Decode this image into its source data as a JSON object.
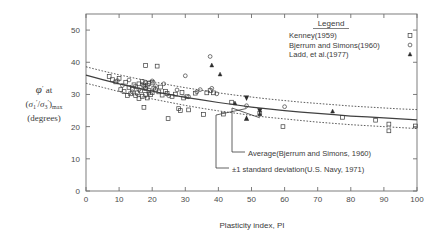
{
  "chart_data": {
    "type": "scatter",
    "title": "",
    "xlabel": "Plasticity index, PI",
    "ylabel_lines": [
      "ϕ' at",
      "(σ1'/σ3')max",
      "(degrees)"
    ],
    "xlim": [
      0,
      100
    ],
    "ylim": [
      0,
      55
    ],
    "xticks": [
      0,
      10,
      20,
      30,
      40,
      50,
      60,
      70,
      80,
      90,
      100
    ],
    "yticks": [
      0,
      10,
      20,
      30,
      40,
      50
    ],
    "xtick_labels": [
      "0",
      "10",
      "20",
      "30",
      "40",
      "50",
      "60",
      "70",
      "80",
      "90",
      "100"
    ],
    "ytick_labels": [
      "0",
      "10",
      "20",
      "30",
      "40",
      "50"
    ],
    "grid": false,
    "legend": {
      "title": "Legend",
      "position": "top-right",
      "entries": [
        {
          "name": "Kenney(1959)",
          "marker": "square",
          "marker_fill": "none"
        },
        {
          "name": "Bjerrum and Simons(1960)",
          "marker": "circle",
          "marker_fill": "none"
        },
        {
          "name": "Ladd, et al.(1977)",
          "marker": "triangle",
          "marker_fill": "solid"
        }
      ]
    },
    "annotations": [
      {
        "text": "Average(Bjerrum and Simons, 1960)",
        "points_to": [
          52.5,
          24.0
        ]
      },
      {
        "text": "±1 standard deviation(U.S. Navy, 1971)",
        "points_to": [
          48.5,
          27.0
        ]
      }
    ],
    "curves": [
      {
        "name": "Average(Bjerrum and Simons, 1960)",
        "style": "solid",
        "x": [
          0,
          5,
          10,
          15,
          20,
          25,
          30,
          35,
          40,
          45,
          50,
          55,
          60,
          65,
          70,
          75,
          80,
          85,
          90,
          95,
          100
        ],
        "y": [
          36.0,
          34.6,
          33.3,
          32.1,
          31.0,
          30.0,
          29.1,
          28.3,
          27.5,
          26.8,
          26.1,
          25.5,
          25.0,
          24.5,
          24.1,
          23.7,
          23.3,
          23.0,
          22.7,
          22.4,
          22.1
        ]
      },
      {
        "name": "+1 standard deviation",
        "style": "dotted",
        "x": [
          0,
          5,
          10,
          15,
          20,
          25,
          30,
          35,
          40,
          45,
          50,
          55,
          60,
          65,
          70,
          75,
          80,
          85,
          90,
          95,
          100
        ],
        "y": [
          38.6,
          37.3,
          36.1,
          35.0,
          34.0,
          33.0,
          32.1,
          31.3,
          30.5,
          29.8,
          29.2,
          28.6,
          28.1,
          27.6,
          27.2,
          26.8,
          26.4,
          26.1,
          25.8,
          25.5,
          25.3
        ]
      },
      {
        "name": "-1 standard deviation",
        "style": "dotted",
        "x": [
          0,
          5,
          10,
          15,
          20,
          25,
          30,
          35,
          40,
          45,
          50,
          55,
          60,
          65,
          70,
          75,
          80,
          85,
          90,
          95,
          100
        ],
        "y": [
          33.5,
          32.2,
          30.9,
          29.7,
          28.6,
          27.6,
          26.6,
          25.7,
          24.9,
          24.2,
          23.5,
          22.9,
          22.4,
          21.9,
          21.4,
          21.0,
          20.6,
          20.3,
          20.0,
          19.7,
          19.4
        ]
      }
    ],
    "series": [
      {
        "name": "Kenney(1959)",
        "marker": "square",
        "points": [
          [
            7.0,
            35.6
          ],
          [
            8.0,
            34.6
          ],
          [
            9.0,
            33.9
          ],
          [
            10.0,
            35.0
          ],
          [
            10.5,
            31.5
          ],
          [
            11.5,
            30.9
          ],
          [
            12.0,
            33.8
          ],
          [
            12.5,
            29.7
          ],
          [
            13.0,
            32.2
          ],
          [
            13.5,
            30.2
          ],
          [
            14.0,
            31.6
          ],
          [
            14.5,
            33.0
          ],
          [
            15.0,
            29.6
          ],
          [
            15.0,
            32.4
          ],
          [
            15.5,
            30.5
          ],
          [
            16.0,
            28.7
          ],
          [
            16.0,
            33.3
          ],
          [
            16.5,
            31.1
          ],
          [
            17.0,
            29.4
          ],
          [
            17.0,
            34.0
          ],
          [
            17.5,
            32.6
          ],
          [
            17.5,
            26.0
          ],
          [
            18.0,
            39.0
          ],
          [
            18.0,
            33.6
          ],
          [
            18.0,
            31.8
          ],
          [
            18.0,
            30.0
          ],
          [
            18.5,
            28.9
          ],
          [
            18.5,
            32.9
          ],
          [
            19.0,
            33.4
          ],
          [
            19.0,
            31.2
          ],
          [
            19.5,
            29.9
          ],
          [
            20.0,
            33.8
          ],
          [
            20.0,
            30.6
          ],
          [
            20.5,
            32.0
          ],
          [
            21.0,
            31.4
          ],
          [
            21.5,
            38.8
          ],
          [
            22.0,
            30.8
          ],
          [
            22.5,
            32.3
          ],
          [
            23.0,
            29.8
          ],
          [
            24.0,
            31.0
          ],
          [
            24.5,
            30.3
          ],
          [
            24.8,
            22.5
          ],
          [
            26.0,
            29.4
          ],
          [
            27.0,
            30.1
          ],
          [
            28.0,
            25.6
          ],
          [
            28.5,
            25.0
          ],
          [
            29.0,
            30.6
          ],
          [
            29.5,
            28.9
          ],
          [
            30.5,
            29.3
          ],
          [
            31.0,
            25.2
          ],
          [
            33.0,
            30.4
          ],
          [
            35.5,
            23.8
          ],
          [
            36.5,
            30.5
          ],
          [
            37.5,
            31.2
          ],
          [
            38.5,
            30.5
          ],
          [
            41.5,
            23.9
          ],
          [
            44.0,
            27.6
          ],
          [
            52.5,
            24.2
          ],
          [
            59.5,
            20.0
          ],
          [
            77.5,
            22.9
          ],
          [
            87.5,
            22.0
          ],
          [
            91.5,
            20.8
          ],
          [
            91.5,
            18.7
          ],
          [
            99.5,
            20.2
          ]
        ]
      },
      {
        "name": "Bjerrum and Simons(1960)",
        "marker": "circle",
        "points": [
          [
            9.5,
            34.3
          ],
          [
            11.0,
            32.8
          ],
          [
            13.0,
            34.5
          ],
          [
            14.0,
            30.8
          ],
          [
            16.0,
            31.5
          ],
          [
            17.0,
            33.1
          ],
          [
            18.0,
            32.1
          ],
          [
            19.0,
            30.4
          ],
          [
            20.0,
            34.2
          ],
          [
            21.0,
            32.7
          ],
          [
            23.5,
            33.3
          ],
          [
            25.0,
            29.6
          ],
          [
            27.5,
            31.4
          ],
          [
            30.0,
            35.8
          ],
          [
            31.0,
            29.3
          ],
          [
            33.5,
            30.8
          ],
          [
            34.5,
            31.5
          ],
          [
            37.5,
            41.8
          ],
          [
            38.0,
            31.9
          ],
          [
            39.5,
            30.2
          ],
          [
            48.5,
            26.5
          ],
          [
            60.0,
            26.2
          ]
        ]
      },
      {
        "name": "Ladd, et al.(1977)",
        "marker": "triangle",
        "points": [
          [
            38.0,
            39.0
          ],
          [
            40.5,
            36.2
          ],
          [
            45.0,
            27.2
          ],
          [
            52.5,
            23.8
          ],
          [
            74.5,
            24.7
          ]
        ]
      }
    ]
  }
}
